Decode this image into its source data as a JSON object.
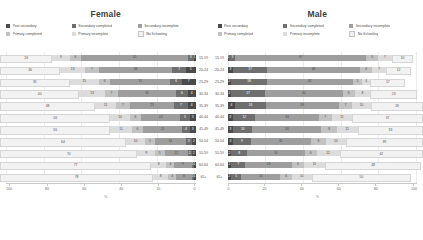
{
  "panels": [
    {
      "id": "female",
      "title": "Female",
      "direction": "rtl"
    },
    {
      "id": "male",
      "title": "Male",
      "direction": "ltr"
    }
  ],
  "legend": {
    "rows": [
      [
        {
          "label": "Post secondary",
          "color": "#4a4a4a"
        },
        {
          "label": "Secondary completed",
          "color": "#6f6f6f"
        },
        {
          "label": "Secondary incomplete",
          "color": "#9e9e9e"
        }
      ],
      [
        {
          "label": "Primary completed",
          "color": "#c2c2c2"
        },
        {
          "label": "Primary incomplete",
          "color": "#dcdcdc"
        },
        {
          "label": "No Schooling",
          "color": "#f2f2f2"
        }
      ]
    ]
  },
  "axis": {
    "female_ticks": [
      "100",
      "80",
      "60",
      "40",
      "20",
      "0"
    ],
    "male_ticks": [
      "0",
      "20",
      "40",
      "60",
      "80",
      "100"
    ],
    "caption": "%"
  },
  "chart_data": {
    "type": "bar",
    "subtitle": "",
    "xlabel": "%",
    "ylabel": "",
    "xlim": [
      0,
      100
    ],
    "grid": true,
    "legend_position": "top",
    "orientation": "horizontal",
    "stacked": "percent",
    "categories": [
      "15-19",
      "20-24",
      "25-29",
      "30-34",
      "35-39",
      "40-44",
      "45-49",
      "50-54",
      "55-59",
      "60-64",
      "65+"
    ],
    "series_names": [
      "Post secondary",
      "Secondary completed",
      "Secondary incomplete",
      "Primary completed",
      "Primary incomplete",
      "No Schooling"
    ],
    "series_colors": [
      "#4a4a4a",
      "#6f6f6f",
      "#9e9e9e",
      "#c2c2c2",
      "#dcdcdc",
      "#f2f2f2"
    ],
    "panels": [
      {
        "name": "Female",
        "series": [
          {
            "name": "Post secondary",
            "values": [
              1,
              5,
              7,
              4,
              4,
              3,
              3,
              2,
              2,
              1,
              1
            ]
          },
          {
            "name": "Secondary completed",
            "values": [
              3,
              7,
              6,
              6,
              7,
              5,
              4,
              3,
              2,
              1,
              1
            ]
          },
          {
            "name": "Secondary incomplete",
            "values": [
              55,
              38,
              31,
              30,
              23,
              20,
              20,
              16,
              12,
              9,
              8
            ]
          },
          {
            "name": "Primary completed",
            "values": [
              6,
              7,
              6,
              7,
              7,
              6,
              6,
              5,
              5,
              4,
              4
            ]
          },
          {
            "name": "Primary incomplete",
            "values": [
              9,
              13,
              15,
              13,
              11,
              10,
              11,
              10,
              9,
              8,
              8
            ]
          },
          {
            "name": "No Schooling",
            "values": [
              26,
              30,
              35,
              40,
              48,
              56,
              56,
              64,
              70,
              77,
              78
            ]
          }
        ]
      },
      {
        "name": "Male",
        "series": [
          {
            "name": "Post secondary",
            "values": [
              1,
              3,
              2,
              2,
              4,
              3,
              3,
              3,
              2,
              2,
              2
            ]
          },
          {
            "name": "Secondary completed",
            "values": [
              3,
              17,
              18,
              17,
              16,
              12,
              10,
              9,
              8,
              7,
              5
            ]
          },
          {
            "name": "Secondary incomplete",
            "values": [
              67,
              48,
              44,
              40,
              38,
              34,
              36,
              31,
              30,
              24,
              20
            ]
          },
          {
            "name": "Primary completed",
            "values": [
              6,
              6,
              5,
              6,
              7,
              7,
              8,
              8,
              6,
              6,
              6
            ]
          },
          {
            "name": "Primary incomplete",
            "values": [
              7,
              7,
              4,
              8,
              10,
              11,
              11,
              10,
              12,
              11,
              10
            ]
          },
          {
            "name": "No Schooling",
            "values": [
              10,
              12,
              17,
              23,
              26,
              37,
              33,
              39,
              42,
              48,
              50
            ]
          }
        ]
      }
    ]
  }
}
